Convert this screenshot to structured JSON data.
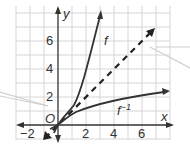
{
  "graph": {
    "axes": {
      "x_label": "x",
      "y_label": "y",
      "origin_label": "O",
      "x_ticks": [
        {
          "value": -2,
          "label": "−2"
        },
        {
          "value": 2,
          "label": "2"
        },
        {
          "value": 4,
          "label": "4"
        },
        {
          "value": 6,
          "label": "6"
        }
      ],
      "y_ticks": [
        {
          "value": 2,
          "label": "2"
        },
        {
          "value": 4,
          "label": "4"
        },
        {
          "value": 6,
          "label": "6"
        }
      ],
      "x_range": [
        -3,
        8
      ],
      "y_range": [
        -1,
        8
      ]
    },
    "curves": [
      {
        "name": "f",
        "label": "f",
        "description": "steep increasing curve"
      },
      {
        "name": "f-inverse",
        "label": "f⁻¹",
        "label_base": "f",
        "label_sup": "−1",
        "description": "reflection of f across y = x"
      },
      {
        "name": "y-equals-x",
        "label": "",
        "description": "dashed line y = x"
      }
    ],
    "colors": {
      "grid": "#d6d6d6",
      "axis": "#333333",
      "curve": "#333333",
      "callout": "#cfcfcf"
    }
  }
}
